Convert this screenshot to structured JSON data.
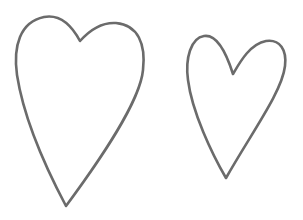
{
  "canvas": {
    "width": 303,
    "height": 220,
    "background": "#ffffff"
  },
  "shapes": [
    {
      "name": "large-heart",
      "stroke": "#6b6b6b",
      "fill": "none",
      "stroke_width": 2.6
    },
    {
      "name": "small-heart",
      "stroke": "#6b6b6b",
      "fill": "none",
      "stroke_width": 2.6
    }
  ]
}
